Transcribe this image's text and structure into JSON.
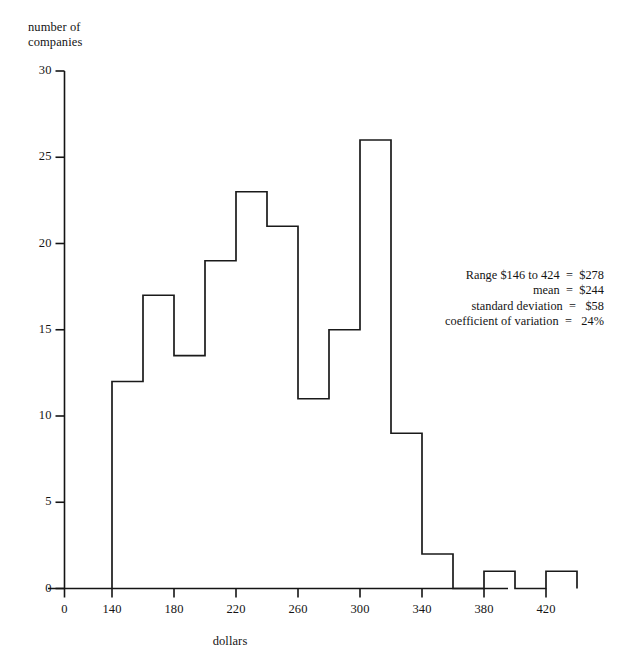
{
  "chart_data": {
    "type": "bar",
    "title": "",
    "subtitle": "",
    "xlabel": "dollars",
    "ylabel": "number of\ncompanies",
    "ylabel_lines": [
      "number of",
      "companies"
    ],
    "xlim": [
      0,
      445
    ],
    "ylim": [
      0,
      30
    ],
    "grid": false,
    "legend": null,
    "bin_width": 20,
    "histogram_style": "outline-step",
    "categories": [
      "140-160",
      "160-180",
      "180-200",
      "200-220",
      "220-240",
      "240-260",
      "260-280",
      "280-300",
      "300-320",
      "320-340",
      "340-360",
      "360-380",
      "380-400",
      "400-420",
      "420-440"
    ],
    "bin_edges": [
      140,
      160,
      180,
      200,
      220,
      240,
      260,
      280,
      300,
      320,
      340,
      360,
      380,
      400,
      420,
      440
    ],
    "values": [
      12,
      17,
      13.5,
      19,
      23,
      21,
      11,
      15,
      26,
      9,
      2,
      0,
      1,
      0,
      1
    ],
    "xticks": [
      0,
      140,
      180,
      220,
      260,
      300,
      340,
      380,
      420
    ],
    "xtick_labels": [
      "0",
      "140",
      "180",
      "220",
      "260",
      "300",
      "340",
      "380",
      "420"
    ],
    "yticks": [
      0,
      5,
      10,
      15,
      20,
      25,
      30
    ],
    "ytick_labels": [
      "0",
      "5",
      "10",
      "15",
      "20",
      "25",
      "30"
    ],
    "annotations": [
      {
        "label": "Range $146 to 424",
        "separator": "=",
        "value": "$278"
      },
      {
        "label": "mean",
        "separator": "=",
        "value": "$244"
      },
      {
        "label": "standard deviation",
        "separator": "=",
        "value": "$58"
      },
      {
        "label": "coefficient of variation",
        "separator": "=",
        "value": "24%"
      }
    ],
    "annotation_lines": [
      "Range $146 to 424  =  $278",
      "mean  =  $244",
      "standard deviation  =   $58",
      "coefficient of variation  =   24%"
    ]
  },
  "colors": {
    "background": "#ffffff",
    "axis": "#141414",
    "line": "#1a1a1a",
    "text": "#141414"
  }
}
